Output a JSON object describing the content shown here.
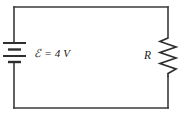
{
  "figure": {
    "background_color": "#ffffff",
    "wire_color": "#3a3a3a",
    "symbol_color": "#2e2e2e",
    "text_color": "#1b1b1b",
    "width": 182,
    "height": 119
  },
  "components": {
    "battery": {
      "name": "battery",
      "symbol": "battery-cell-symbol",
      "label_text": "ℰ = 4 V",
      "emf_symbol": "ℰ",
      "equals": "=",
      "value": "4",
      "unit": "V",
      "plate_count": 4
    },
    "resistor": {
      "name": "resistor",
      "symbol": "resistor-zigzag-symbol",
      "label_text": "R",
      "zigzag_peaks": 7
    },
    "wires": {
      "name": "wire-loop",
      "shape": "rectangle",
      "left_x": 14,
      "right_x": 168,
      "top_y": 7,
      "bottom_y": 108
    }
  }
}
